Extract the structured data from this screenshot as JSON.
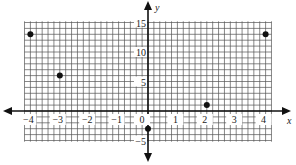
{
  "chart_data": {
    "type": "scatter",
    "title": "",
    "xlabel": "x",
    "ylabel": "y",
    "xlim": [
      -4.2,
      4.2
    ],
    "ylim": [
      -5.2,
      15.2
    ],
    "grid": true,
    "grid_minor_x": 0.2,
    "grid_minor_y": 1,
    "x_ticks": [
      -4,
      -3,
      -2,
      -1,
      0,
      1,
      2,
      3,
      4
    ],
    "x_tick_labels": [
      "−4",
      "−3",
      "−2",
      "−1",
      "0",
      "1",
      "2",
      "3",
      "4"
    ],
    "y_ticks": [
      -5,
      5,
      10,
      15
    ],
    "y_tick_labels": [
      "−5",
      "5",
      "10",
      "15"
    ],
    "points": [
      {
        "x": -4,
        "y": 13
      },
      {
        "x": -3,
        "y": 6
      },
      {
        "x": 0,
        "y": -3
      },
      {
        "x": 2,
        "y": 1
      },
      {
        "x": 4,
        "y": 13
      }
    ],
    "legend": null
  },
  "colors": {
    "grid": "#555555",
    "axis": "#111111",
    "point": "#111111",
    "background": "#ffffff"
  }
}
